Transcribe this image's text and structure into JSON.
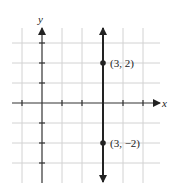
{
  "diagram": {
    "type": "coordinate-plane",
    "axes": {
      "x_label": "x",
      "y_label": "y"
    },
    "grid": {
      "x_min": -2,
      "x_max": 5,
      "y_min": -3,
      "y_max": 4,
      "unit_px": 20
    },
    "vertical_line": {
      "equation": "x = 3",
      "x": 3
    },
    "points": [
      {
        "label": "(3, 2)",
        "x": 3,
        "y": 2
      },
      {
        "label": "(3, −2)",
        "x": 3,
        "y": -2
      }
    ],
    "colors": {
      "grid": "#cfcfcf",
      "axis": "#333333",
      "line": "#222222"
    }
  }
}
